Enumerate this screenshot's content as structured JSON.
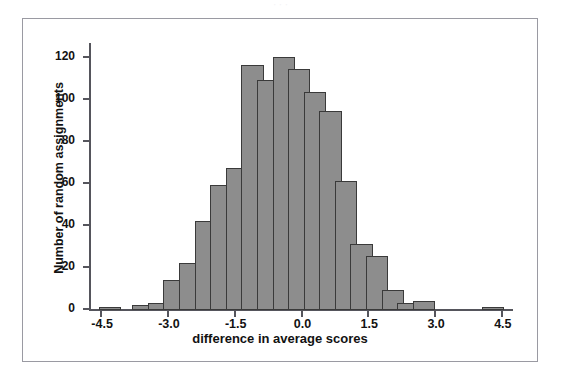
{
  "figure": {
    "caption_artifact": "· · ·",
    "panel_border_color": "#9a9aa2",
    "bar_fill_color": "#8d8d8d",
    "bar_edge_color": "#3a3a3a",
    "axis_color": "#55555c"
  },
  "chart_data": {
    "type": "bar",
    "title": "",
    "xlabel": "difference in average scores",
    "ylabel": "Number of random assignments",
    "bin_width": 0.5,
    "xlim": [
      -4.75,
      4.75
    ],
    "ylim": [
      0,
      126
    ],
    "grid": false,
    "legend": null,
    "xticks": [
      "-4.5",
      "-3.0",
      "-1.5",
      "0.0",
      "1.5",
      "3.0",
      "4.5"
    ],
    "xtick_values": [
      -4.5,
      -3.0,
      -1.5,
      0.0,
      1.5,
      3.0,
      4.5
    ],
    "yticks": [
      "0",
      "20",
      "40",
      "60",
      "80",
      "100",
      "120"
    ],
    "ytick_values": [
      0,
      20,
      40,
      60,
      80,
      100,
      120
    ],
    "bins": [
      {
        "left": -4.5,
        "right": -4.0,
        "center": -4.25,
        "value": 1
      },
      {
        "left": -3.5,
        "right": -3.25,
        "center": -3.375,
        "value": 2
      },
      {
        "left": -3.25,
        "right": -3.0,
        "center": -3.125,
        "value": 3
      },
      {
        "left": -3.0,
        "right": -2.75,
        "center": -2.875,
        "value": 14
      },
      {
        "left": -2.75,
        "right": -2.5,
        "center": -2.625,
        "value": 22
      },
      {
        "left": -2.5,
        "right": -2.25,
        "center": -2.375,
        "value": 42
      },
      {
        "left": -2.25,
        "right": -2.0,
        "center": -2.125,
        "value": 59
      },
      {
        "left": -2.0,
        "right": -1.75,
        "center": -1.875,
        "value": 67
      },
      {
        "left": -1.75,
        "right": -1.5,
        "center": -1.625,
        "value": 116
      },
      {
        "left": -1.5,
        "right": -1.25,
        "center": -1.375,
        "value": 109
      },
      {
        "left": -1.25,
        "right": -1.0,
        "center": -1.125,
        "value": 120
      },
      {
        "left": -1.0,
        "right": -0.75,
        "center": -0.875,
        "value": 114
      },
      {
        "left": -0.75,
        "right": -0.5,
        "center": -0.625,
        "value": 103
      },
      {
        "left": -0.5,
        "right": -0.25,
        "center": -0.375,
        "value": 94
      },
      {
        "left": -0.25,
        "right": 0.0,
        "center": -0.125,
        "value": 61
      },
      {
        "left": 0.0,
        "right": 0.25,
        "center": 0.125,
        "value": 31
      },
      {
        "left": 0.25,
        "right": 0.5,
        "center": 0.375,
        "value": 25
      },
      {
        "left": 0.5,
        "right": 0.75,
        "center": 0.625,
        "value": 9
      },
      {
        "left": 0.75,
        "right": 1.0,
        "center": 0.875,
        "value": 3
      },
      {
        "left": 1.0,
        "right": 1.25,
        "center": 1.125,
        "value": 4
      },
      {
        "left": 1.5,
        "right": 1.75,
        "center": 1.625,
        "value": 1
      }
    ],
    "bar_values": [
      1,
      2,
      3,
      14,
      22,
      42,
      59,
      67,
      116,
      109,
      120,
      114,
      103,
      94,
      61,
      31,
      25,
      9,
      3,
      4,
      1
    ],
    "bar_centers": [
      -4.3,
      -3.55,
      -3.2,
      -2.85,
      -2.5,
      -2.15,
      -1.8,
      -1.45,
      -1.1,
      -0.75,
      -0.4,
      -0.05,
      0.3,
      0.65,
      1.0,
      1.35,
      1.7,
      2.05,
      2.4,
      2.75,
      4.3
    ]
  }
}
